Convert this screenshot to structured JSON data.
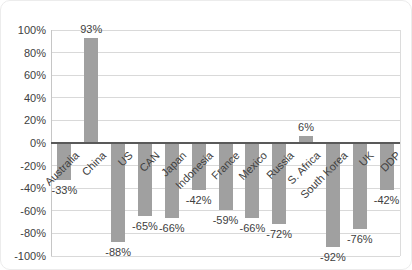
{
  "chart_data": {
    "type": "bar",
    "title": "",
    "xlabel": "",
    "ylabel": "",
    "categories": [
      "Australia",
      "China",
      "US",
      "CAN",
      "Japan",
      "Indonesia",
      "France",
      "Mexico",
      "Russia",
      "S. Africa",
      "South Korea",
      "UK",
      "DDP"
    ],
    "values": [
      -33,
      93,
      -88,
      -65,
      -66,
      -42,
      -59,
      -66,
      -72,
      6,
      -92,
      -76,
      -42
    ],
    "data_labels": [
      "-33%",
      "93%",
      "-88%",
      "-65%",
      "-66%",
      "-42%",
      "-59%",
      "-66%",
      "-72%",
      "6%",
      "-92%",
      "-76%",
      "-42%"
    ],
    "y_ticks": [
      "100%",
      "80%",
      "60%",
      "40%",
      "20%",
      "0%",
      "-20%",
      "-40%",
      "-60%",
      "-80%",
      "-100%"
    ],
    "ylim": [
      -100,
      100
    ],
    "grid": true,
    "legend": "none",
    "colors": {
      "bar": "#a0a0a0",
      "gridline": "#d9d9d9",
      "zero_line": "#595959",
      "axis_line": "#c6c6c6",
      "plot_right_line": "#dcdcdc",
      "axis_text": "#404040",
      "background": "#ffffff"
    }
  }
}
